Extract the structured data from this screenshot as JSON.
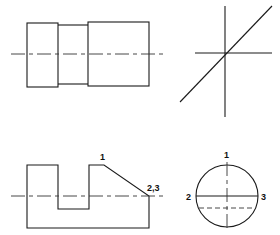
{
  "figure": {
    "type": "orthographic-projection-exercise",
    "views": [
      {
        "id": "top-left",
        "description": "stepped cylinder side view",
        "centerline": true
      },
      {
        "id": "top-right",
        "description": "axes with 45-degree miter line"
      },
      {
        "id": "bottom-left",
        "description": "notched profile with chamfer",
        "labels": [
          "1",
          "2,3"
        ]
      },
      {
        "id": "bottom-right",
        "description": "circular end view",
        "labels": [
          "1",
          "2",
          "3"
        ]
      }
    ],
    "labels": {
      "profile_point_1": "1",
      "profile_point_23": "2,3",
      "circle_point_1": "1",
      "circle_point_2": "2",
      "circle_point_3": "3"
    },
    "colors": {
      "line": "#1a1a1a",
      "background": "#ffffff"
    }
  }
}
